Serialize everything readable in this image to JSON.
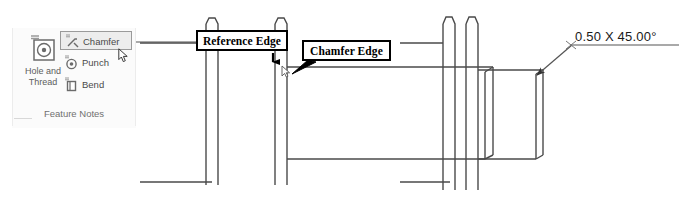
{
  "ribbon": {
    "panel_title": "Feature Notes",
    "big_button": {
      "label": "Hole and\nThread",
      "icon": "hole-thread-icon"
    },
    "items": [
      {
        "label": "Chamfer",
        "icon": "chamfer-icon",
        "selected": true
      },
      {
        "label": "Punch",
        "icon": "punch-icon",
        "selected": false
      },
      {
        "label": "Bend",
        "icon": "bend-icon",
        "selected": false
      }
    ],
    "cursor": "mouse-pointer-icon"
  },
  "annotations": {
    "reference_edge_label": "Reference Edge",
    "chamfer_edge_label": "Chamfer Edge",
    "chamfer_dimension": "0.50 X 45.00°"
  },
  "colors": {
    "line": "#4a4a4a",
    "annotation": "#000000",
    "panel_text": "#5d5d5d"
  }
}
